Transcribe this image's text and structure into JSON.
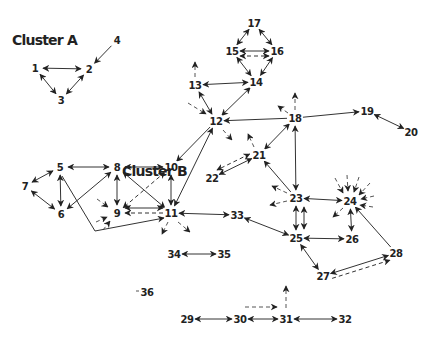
{
  "diagram": {
    "type": "network",
    "clusters": [
      {
        "label": "Cluster A",
        "x": 12,
        "y": 45
      },
      {
        "label": "Cluster B",
        "x": 122,
        "y": 176
      }
    ],
    "nodes": [
      {
        "id": "1",
        "x": 35,
        "y": 68
      },
      {
        "id": "2",
        "x": 89,
        "y": 69
      },
      {
        "id": "3",
        "x": 61,
        "y": 100
      },
      {
        "id": "4",
        "x": 117,
        "y": 40
      },
      {
        "id": "5",
        "x": 60,
        "y": 167
      },
      {
        "id": "6",
        "x": 61,
        "y": 214
      },
      {
        "id": "7",
        "x": 25,
        "y": 186
      },
      {
        "id": "8",
        "x": 117,
        "y": 167
      },
      {
        "id": "9",
        "x": 117,
        "y": 213
      },
      {
        "id": "10",
        "x": 171,
        "y": 167
      },
      {
        "id": "11",
        "x": 171,
        "y": 213
      },
      {
        "id": "12",
        "x": 216,
        "y": 121
      },
      {
        "id": "13",
        "x": 195,
        "y": 85
      },
      {
        "id": "14",
        "x": 256,
        "y": 82
      },
      {
        "id": "15",
        "x": 232,
        "y": 51
      },
      {
        "id": "16",
        "x": 277,
        "y": 51
      },
      {
        "id": "17",
        "x": 254,
        "y": 23
      },
      {
        "id": "18",
        "x": 295,
        "y": 118
      },
      {
        "id": "19",
        "x": 367,
        "y": 111
      },
      {
        "id": "20",
        "x": 411,
        "y": 132
      },
      {
        "id": "21",
        "x": 259,
        "y": 155
      },
      {
        "id": "22",
        "x": 212,
        "y": 178
      },
      {
        "id": "23",
        "x": 296,
        "y": 198
      },
      {
        "id": "24",
        "x": 350,
        "y": 201
      },
      {
        "id": "25",
        "x": 296,
        "y": 238
      },
      {
        "id": "26",
        "x": 352,
        "y": 239
      },
      {
        "id": "27",
        "x": 323,
        "y": 276
      },
      {
        "id": "28",
        "x": 396,
        "y": 253
      },
      {
        "id": "29",
        "x": 187,
        "y": 319
      },
      {
        "id": "30",
        "x": 240,
        "y": 319
      },
      {
        "id": "31",
        "x": 286,
        "y": 319
      },
      {
        "id": "32",
        "x": 345,
        "y": 319
      },
      {
        "id": "33",
        "x": 237,
        "y": 215
      },
      {
        "id": "34",
        "x": 174,
        "y": 254
      },
      {
        "id": "35",
        "x": 224,
        "y": 254
      },
      {
        "id": "36",
        "x": 147,
        "y": 292
      }
    ],
    "edges": [
      {
        "from": "1",
        "to": "2",
        "dir": "both",
        "style": "solid"
      },
      {
        "from": "1",
        "to": "3",
        "dir": "both",
        "style": "solid"
      },
      {
        "from": "2",
        "to": "3",
        "dir": "both",
        "style": "solid"
      },
      {
        "from": "4",
        "to": "2",
        "dir": "forward",
        "style": "solid"
      },
      {
        "from": "5",
        "to": "8",
        "dir": "both",
        "style": "solid"
      },
      {
        "from": "5",
        "to": "6",
        "dir": "both",
        "style": "solid"
      },
      {
        "from": "5",
        "to": "7",
        "dir": "both",
        "style": "solid"
      },
      {
        "from": "6",
        "to": "7",
        "dir": "both",
        "style": "solid"
      },
      {
        "from": "6",
        "to": "8",
        "dir": "both",
        "style": "solid"
      },
      {
        "from": "8",
        "to": "10",
        "dir": "both",
        "style": "solid"
      },
      {
        "from": "8",
        "to": "9",
        "dir": "both",
        "style": "solid"
      },
      {
        "from": "8",
        "to": "11",
        "dir": "both",
        "style": "solid"
      },
      {
        "from": "10",
        "to": "9",
        "dir": "both",
        "style": "dashed"
      },
      {
        "from": "10",
        "to": "11",
        "dir": "both",
        "style": "solid"
      },
      {
        "from": "11",
        "to": "9",
        "dir": "forward",
        "style": "dashed"
      },
      {
        "from": "11",
        "to": "9",
        "dir": "both",
        "style": "solid"
      },
      {
        "from": "12",
        "to": "10",
        "dir": "forward",
        "style": "solid"
      },
      {
        "from": "12",
        "to": "11",
        "dir": "both",
        "style": "solid"
      },
      {
        "from": "11",
        "to": "33",
        "dir": "both",
        "style": "solid"
      },
      {
        "from": "12",
        "to": "13",
        "dir": "both",
        "style": "solid"
      },
      {
        "from": "12",
        "to": "14",
        "dir": "both",
        "style": "solid"
      },
      {
        "from": "13",
        "to": "14",
        "dir": "both",
        "style": "solid"
      },
      {
        "from": "14",
        "to": "15",
        "dir": "both",
        "style": "solid"
      },
      {
        "from": "14",
        "to": "16",
        "dir": "both",
        "style": "solid"
      },
      {
        "from": "15",
        "to": "16",
        "dir": "both",
        "style": "solid"
      },
      {
        "from": "15",
        "to": "16",
        "dir": "both",
        "style": "dashed"
      },
      {
        "from": "15",
        "to": "17",
        "dir": "both",
        "style": "solid"
      },
      {
        "from": "16",
        "to": "17",
        "dir": "both",
        "style": "solid"
      },
      {
        "from": "18",
        "to": "12",
        "dir": "forward",
        "style": "solid"
      },
      {
        "from": "18",
        "to": "19",
        "dir": "forward",
        "style": "solid"
      },
      {
        "from": "19",
        "to": "20",
        "dir": "both",
        "style": "solid"
      },
      {
        "from": "18",
        "to": "21",
        "dir": "both",
        "style": "solid"
      },
      {
        "from": "18",
        "to": "23",
        "dir": "both",
        "style": "solid"
      },
      {
        "from": "21",
        "to": "22",
        "dir": "both",
        "style": "solid"
      },
      {
        "from": "21",
        "to": "22",
        "dir": "both",
        "style": "dashed"
      },
      {
        "from": "23",
        "to": "21",
        "dir": "forward",
        "style": "solid"
      },
      {
        "from": "23",
        "to": "24",
        "dir": "both",
        "style": "solid"
      },
      {
        "from": "23",
        "to": "25",
        "dir": "both",
        "style": "solid"
      },
      {
        "from": "24",
        "to": "26",
        "dir": "both",
        "style": "solid"
      },
      {
        "from": "25",
        "to": "26",
        "dir": "both",
        "style": "solid"
      },
      {
        "from": "25",
        "to": "33",
        "dir": "both",
        "style": "solid"
      },
      {
        "from": "25",
        "to": "27",
        "dir": "both",
        "style": "solid"
      },
      {
        "from": "27",
        "to": "28",
        "dir": "both",
        "style": "solid"
      },
      {
        "from": "27",
        "to": "28",
        "dir": "forward",
        "style": "dashed"
      },
      {
        "from": "28",
        "to": "24",
        "dir": "forward",
        "style": "solid"
      },
      {
        "from": "34",
        "to": "35",
        "dir": "both",
        "style": "solid"
      },
      {
        "from": "29",
        "to": "30",
        "dir": "both",
        "style": "solid"
      },
      {
        "from": "30",
        "to": "31",
        "dir": "both",
        "style": "solid"
      },
      {
        "from": "31",
        "to": "32",
        "dir": "both",
        "style": "solid"
      }
    ]
  }
}
